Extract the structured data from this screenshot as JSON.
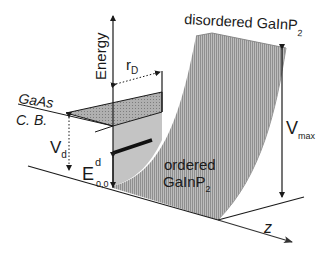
{
  "diagram": {
    "colors": {
      "surface_fill": "#b8b8b8",
      "surface_hatch": "#8a8a8a",
      "plateau_fill": "#a9a9a9",
      "line": "#1a1a1a",
      "background": "#ffffff"
    },
    "labels": {
      "energy_axis": "Energy",
      "r_d": "r",
      "r_d_sub": "D",
      "gaas_line1": "GaAs",
      "gaas_line2": "C. B.",
      "v_d": "V",
      "v_d_sub": "d",
      "e_main": "E",
      "e_sup": "d",
      "e_sub": "0,0",
      "disordered": "disordered GaInP",
      "disordered_sub": "2",
      "ordered_line1": "ordered",
      "ordered_line2": "GaInP",
      "ordered_sub": "2",
      "v_max": "V",
      "v_max_sub": "max",
      "z_axis": "z"
    }
  }
}
